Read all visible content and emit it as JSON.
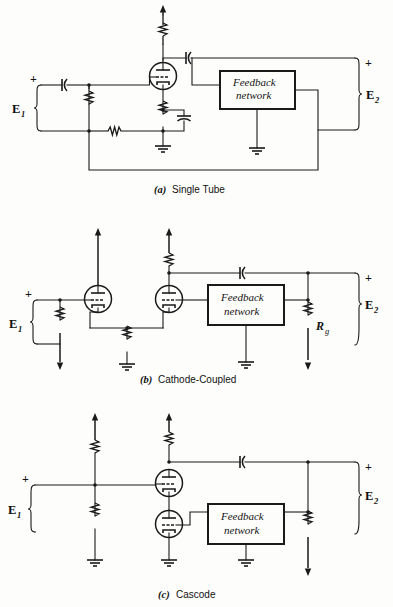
{
  "figure": {
    "background_color": "#fdfdfc",
    "line_color": "#1a1a1a"
  },
  "panels": [
    {
      "id": "a",
      "caption_index": "(a)",
      "caption_text": "Single Tube",
      "input_label": "E",
      "input_sub": "1",
      "input_polarity": "+",
      "output_label": "E",
      "output_sub": "2",
      "output_polarity": "+",
      "feedback_box": {
        "line1": "Feedback",
        "line2": "network"
      },
      "components": [
        "plate-load-resistor",
        "coupling-capacitor-input",
        "coupling-capacitor-output",
        "grid-resistor",
        "cathode-resistor",
        "cathode-bypass-capacitor",
        "series-feedback-resistor",
        "triode-tube"
      ],
      "tube_count": 1,
      "ground_count": 2
    },
    {
      "id": "b",
      "caption_index": "(b)",
      "caption_text": "Cathode-Coupled",
      "input_label": "E",
      "input_sub": "1",
      "input_polarity": "+",
      "output_label": "E",
      "output_sub": "2",
      "output_polarity": "+",
      "feedback_box": {
        "line1": "Feedback",
        "line2": "network"
      },
      "resistor_label": "R",
      "resistor_sub": "g",
      "components": [
        "grid-resistor",
        "plate-load-resistor",
        "common-cathode-resistor",
        "coupling-capacitor-output",
        "grid-return-resistor",
        "triode-tube-1",
        "triode-tube-2"
      ],
      "tube_count": 2,
      "ground_count": 2
    },
    {
      "id": "c",
      "caption_index": "(c)",
      "caption_text": "Cascode",
      "input_label": "E",
      "input_sub": "1",
      "input_polarity": "+",
      "output_label": "E",
      "output_sub": "2",
      "output_polarity": "+",
      "feedback_box": {
        "line1": "Feedback",
        "line2": "network"
      },
      "components": [
        "upper-bias-resistor",
        "lower-bias-resistor",
        "plate-load-resistor",
        "coupling-capacitor-output",
        "grid-resistor",
        "triode-tube-upper",
        "triode-tube-lower"
      ],
      "tube_count": 2,
      "ground_count": 4
    }
  ]
}
